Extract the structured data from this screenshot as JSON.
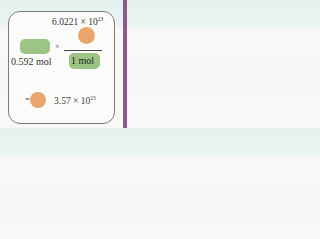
{
  "diagram": {
    "numerator": {
      "mantissa": "6.0221 × 10",
      "exponent": "23"
    },
    "multiply_sign": "×",
    "denominator": "1 mol",
    "given_value": "0.592 mol",
    "equals_sign": "=",
    "result": {
      "mantissa": "3.57 × 10",
      "exponent": "23"
    },
    "colors": {
      "green_box": "#9cc483",
      "orange_circle": "#e9a56c",
      "accent_bar": "#8a5a88",
      "header_tint": "#e3f1ef"
    }
  }
}
